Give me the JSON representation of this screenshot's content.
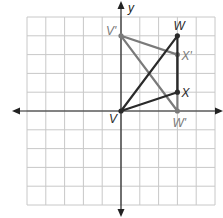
{
  "diagram": {
    "type": "coordinate-plane-transformation",
    "axes": {
      "x_label": "x",
      "y_label": "y",
      "x_range": [
        -5,
        5
      ],
      "y_range": [
        -5,
        5
      ],
      "grid": true
    },
    "colors": {
      "grid": "#c8c8c8",
      "axis": "#222222",
      "original": "#2a2a2a",
      "image": "#7a7a7a",
      "background": "#ffffff"
    },
    "original_triangle": {
      "name": "VWX",
      "points": [
        {
          "label": "V",
          "x": 0,
          "y": 0,
          "label_pos": "lower-left"
        },
        {
          "label": "W",
          "x": 3,
          "y": 4,
          "label_pos": "above"
        },
        {
          "label": "X",
          "x": 3,
          "y": 1,
          "label_pos": "right"
        }
      ]
    },
    "image_triangle": {
      "name": "V'W'X'",
      "points": [
        {
          "label": "V'",
          "x": 0,
          "y": 4,
          "label_pos": "left"
        },
        {
          "label": "W'",
          "x": 3,
          "y": 0,
          "label_pos": "below"
        },
        {
          "label": "X'",
          "x": 3,
          "y": 3,
          "label_pos": "right"
        }
      ]
    }
  }
}
